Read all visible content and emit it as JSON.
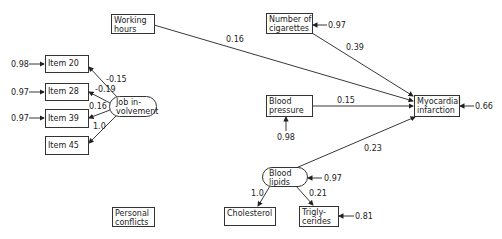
{
  "nodes": {
    "working_hours": "Working\nhours",
    "number_of_cigarettes": "Number of\ncigarettes",
    "item_20": "Item 20",
    "item_28": "Item 28",
    "item_39": "Item 39",
    "item_45": "Item 45",
    "job_involvement": "Job in-\nvolvement",
    "blood_pressure": "Blood\npressure",
    "myocardial_infarction": "Myocardial\ninfarction",
    "blood_lipids": "Blood\nlipids",
    "cholesterol": "Cholesterol",
    "triglycerides": "Trigly-\ncerides",
    "personal_conflicts": "Personal\nconflicts"
  },
  "edges": {
    "working_hours_to_mi": "0.16",
    "cigarettes_to_mi": "0.39",
    "blood_pressure_to_mi": "0.15",
    "blood_lipids_to_mi": "0.23",
    "job_to_item20": "-0.15",
    "job_to_item28": "-0.19",
    "job_to_item39": "0.16",
    "job_to_item45": "1.0",
    "lipids_to_cholesterol": "1.0",
    "lipids_to_triglycerides": "0.21"
  },
  "residuals": {
    "item_20": "0.98",
    "item_28": "0.97",
    "item_39": "0.97",
    "cigarettes": "0.97",
    "myocardial_infarction": "0.66",
    "blood_pressure": "0.98",
    "blood_lipids": "0.97",
    "triglycerides": "0.81"
  }
}
